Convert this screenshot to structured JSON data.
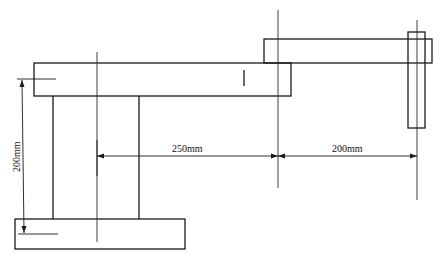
{
  "diagram": {
    "type": "mechanical drawing",
    "parts": [
      {
        "name": "base",
        "x": 15,
        "y": 219,
        "w": 170,
        "h": 30
      },
      {
        "name": "column",
        "x": 53,
        "y": 96,
        "w": 86,
        "h": 123
      },
      {
        "name": "upper-arm",
        "x": 34,
        "y": 63,
        "w": 257,
        "h": 33
      },
      {
        "name": "forearm",
        "x": 264,
        "y": 39,
        "w": 168,
        "h": 24
      },
      {
        "name": "end-effector",
        "x": 408,
        "y": 32,
        "w": 17,
        "h": 96
      }
    ],
    "dimensions": {
      "arm1_length": "250mm",
      "arm2_length": "200mm",
      "column_height": "200mm"
    }
  },
  "colors": {
    "line": "#1a1a1a",
    "background": "#ffffff"
  }
}
